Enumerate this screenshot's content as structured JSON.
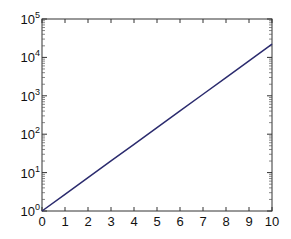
{
  "chart_data": {
    "type": "line",
    "title": "",
    "xlabel": "",
    "ylabel": "",
    "xscale": "linear",
    "yscale": "log",
    "xlim": [
      0,
      10
    ],
    "ylim": [
      1,
      100000
    ],
    "grid": false,
    "legend": null,
    "x_ticks": [
      "0",
      "1",
      "2",
      "3",
      "4",
      "5",
      "6",
      "7",
      "8",
      "9",
      "10"
    ],
    "y_ticks": [
      {
        "base": "10",
        "exp": "0",
        "value": 1
      },
      {
        "base": "10",
        "exp": "1",
        "value": 10
      },
      {
        "base": "10",
        "exp": "2",
        "value": 100
      },
      {
        "base": "10",
        "exp": "3",
        "value": 1000
      },
      {
        "base": "10",
        "exp": "4",
        "value": 10000
      },
      {
        "base": "10",
        "exp": "5",
        "value": 100000
      }
    ],
    "series": [
      {
        "name": "exp(x)",
        "color": "#2b2b6e",
        "x": [
          0,
          1,
          2,
          3,
          4,
          5,
          6,
          7,
          8,
          9,
          10
        ],
        "y": [
          1,
          2.718,
          7.389,
          20.09,
          54.6,
          148.4,
          403.4,
          1096.6,
          2981,
          8103,
          22026
        ]
      }
    ]
  }
}
